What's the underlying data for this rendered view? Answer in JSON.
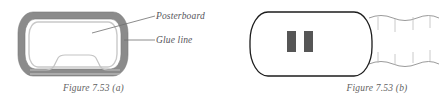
{
  "figure": {
    "number": "7.53",
    "panels": [
      {
        "id": "a",
        "caption": "Figure 7.53 (a)",
        "callouts": [
          {
            "name": "posterboard",
            "label": "Posterboard"
          },
          {
            "name": "glue-line",
            "label": "Glue line"
          }
        ],
        "colors": {
          "band_fill": "#8b8b8b",
          "band_edge": "#767676",
          "inner_line": "#c9c9c9",
          "interior": "#ffffff",
          "leader_line": "#6e6e6e"
        }
      },
      {
        "id": "b",
        "caption": "Figure 7.53 (b)",
        "parts": [
          {
            "name": "glue-tab-left",
            "label": ""
          },
          {
            "name": "glue-tab-right",
            "label": ""
          },
          {
            "name": "corrugated-flute-edge",
            "label": ""
          }
        ],
        "colors": {
          "outline": "#1c1c1c",
          "tab_fill": "#565656",
          "flute_line": "#8f8f8f",
          "interior": "#ffffff"
        }
      }
    ]
  }
}
